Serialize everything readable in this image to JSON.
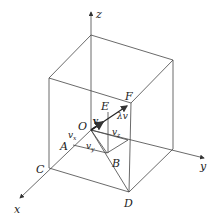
{
  "figure": {
    "type": "3D vector decomposition diagram in a box",
    "axes": {
      "x": "x",
      "y": "y",
      "z": "z"
    },
    "points": {
      "O": "O",
      "A": "A",
      "B": "B",
      "C": "C",
      "D": "D",
      "E": "E",
      "F": "F"
    },
    "vector_labels": {
      "v": "v",
      "lambda_v": "λv",
      "v_x": "v",
      "v_x_sub": "x",
      "v_y": "v",
      "v_y_sub": "y",
      "v_z": "v",
      "v_z_sub": "z"
    },
    "colors": {
      "line": "#444444",
      "text": "#222222",
      "background": "#ffffff"
    }
  }
}
